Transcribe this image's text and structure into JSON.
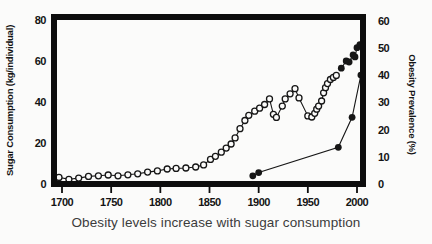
{
  "figure": {
    "caption": "Obesity levels increase with sugar consumption"
  },
  "chart_data": {
    "type": "line",
    "title": "",
    "caption": "Obesity levels increase with sugar consumption",
    "xlabel": "",
    "ylabel_left": "Sugar Consumption (kg/individual)",
    "ylabel_right": "Obesity Prevalence (%)",
    "xlim": [
      1694,
      2010
    ],
    "x_ticks": [
      1700,
      1750,
      1800,
      1850,
      1900,
      1950,
      2000
    ],
    "ylim_left": [
      0,
      80
    ],
    "y_ticks_left": [
      0,
      20,
      40,
      60,
      80
    ],
    "ylim_right": [
      0,
      60
    ],
    "y_ticks_right": [
      0,
      10,
      20,
      30,
      40,
      50,
      60
    ],
    "grid": false,
    "legend": "none",
    "series": [
      {
        "name": "sugar-consumption-historical",
        "axis": "left",
        "marker": "open-circle",
        "points": [
          [
            1697,
            3.2
          ],
          [
            1707,
            2.3
          ],
          [
            1717,
            2.9
          ],
          [
            1727,
            3.7
          ],
          [
            1737,
            4.0
          ],
          [
            1747,
            4.4
          ],
          [
            1757,
            4.0
          ],
          [
            1767,
            4.5
          ],
          [
            1777,
            5.0
          ],
          [
            1787,
            5.8
          ],
          [
            1797,
            6.4
          ],
          [
            1807,
            7.3
          ],
          [
            1816,
            7.6
          ],
          [
            1826,
            7.8
          ],
          [
            1836,
            8.3
          ],
          [
            1844,
            9.3
          ],
          [
            1851,
            12.0
          ],
          [
            1856,
            13.5
          ],
          [
            1862,
            15.5
          ],
          [
            1867,
            17.5
          ],
          [
            1872,
            19.5
          ],
          [
            1876,
            22.5
          ],
          [
            1881,
            27.0
          ],
          [
            1886,
            31.0
          ],
          [
            1890,
            33.5
          ],
          [
            1896,
            35.5
          ],
          [
            1901,
            37.0
          ],
          [
            1906,
            38.8
          ],
          [
            1911,
            41.5
          ],
          [
            1915,
            34.0
          ],
          [
            1918,
            32.5
          ],
          [
            1924,
            38.0
          ],
          [
            1927,
            41.5
          ],
          [
            1932,
            44.0
          ],
          [
            1937,
            46.5
          ],
          [
            1941,
            42.0
          ],
          [
            1950,
            33.2
          ],
          [
            1954,
            32.7
          ],
          [
            1957,
            34.5
          ],
          [
            1959,
            36.5
          ],
          [
            1961,
            38.0
          ],
          [
            1964,
            40.5
          ],
          [
            1966,
            44.5
          ],
          [
            1968,
            47.0
          ],
          [
            1970,
            49.0
          ],
          [
            1973,
            51.0
          ],
          [
            1976,
            52.0
          ],
          [
            1979,
            53.0
          ]
        ]
      },
      {
        "name": "sugar-consumption-recent",
        "axis": "left",
        "marker": "filled-circle",
        "points": [
          [
            1984,
            56.5
          ],
          [
            1989,
            60.0
          ],
          [
            1992,
            59.5
          ],
          [
            1996,
            63.0
          ],
          [
            1998,
            62.0
          ],
          [
            2000,
            66.5
          ],
          [
            2003,
            68.0
          ]
        ]
      },
      {
        "name": "obesity-prevalence",
        "axis": "right",
        "marker": "filled-circle",
        "points": [
          [
            1894,
            3.0
          ],
          [
            1900,
            4.2
          ],
          [
            1981,
            13.5
          ],
          [
            1995,
            24.5
          ],
          [
            2004,
            40.0
          ]
        ]
      }
    ],
    "colors": {
      "line": "#161616",
      "frame": "#0d0d0d",
      "tick_text": "#141414",
      "open_marker_fill": "#fbfbfa",
      "caption_text": "#3c3c3c",
      "background": "#fbfbfa"
    }
  }
}
